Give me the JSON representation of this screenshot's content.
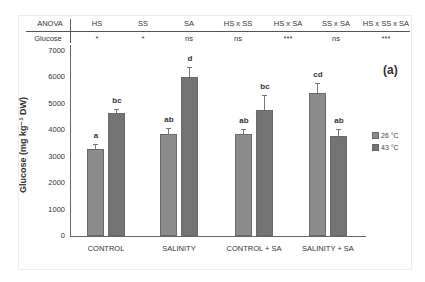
{
  "anova": {
    "row_header": "ANOVA",
    "row_label": "Glucose",
    "columns": [
      {
        "factor": "HS",
        "sig": "*"
      },
      {
        "factor": "SS",
        "sig": "*"
      },
      {
        "factor": "SA",
        "sig": "ns"
      },
      {
        "factor": "HS x SS",
        "sig": "ns"
      },
      {
        "factor": "HS x SA",
        "sig": "***"
      },
      {
        "factor": "SS x SA",
        "sig": "ns"
      },
      {
        "factor": "HS x SS x SA",
        "sig": "***"
      }
    ]
  },
  "panel_label": "(a)",
  "legend": [
    {
      "label": "26 °C",
      "color": "#8c8c8c"
    },
    {
      "label": "43 °C",
      "color": "#747474"
    }
  ],
  "chart_data": {
    "type": "bar",
    "title": "",
    "xlabel": "",
    "ylabel": "Glucose (mg kg⁻¹ DW)",
    "ylim": [
      0,
      7000
    ],
    "yticks": [
      0,
      1000,
      2000,
      3000,
      4000,
      5000,
      6000,
      7000
    ],
    "grid": false,
    "legend_position": "right",
    "categories": [
      "CONTROL",
      "SALINITY",
      "CONTROL + SA",
      "SALINITY + SA"
    ],
    "series": [
      {
        "name": "26 °C",
        "color": "#8c8c8c",
        "values": [
          3300,
          3850,
          3850,
          5400
        ],
        "errors": [
          200,
          250,
          200,
          400
        ],
        "letters": [
          "a",
          "ab",
          "ab",
          "cd"
        ]
      },
      {
        "name": "43 °C",
        "color": "#747474",
        "values": [
          4650,
          6000,
          4750,
          3780
        ],
        "errors": [
          150,
          400,
          600,
          250
        ],
        "letters": [
          "bc",
          "d",
          "bc",
          "ab"
        ]
      }
    ]
  }
}
